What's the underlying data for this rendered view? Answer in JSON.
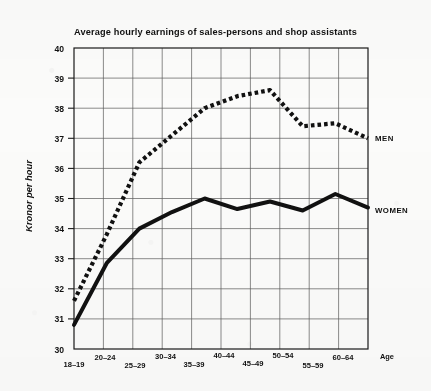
{
  "chart_data": {
    "type": "line",
    "title": "Average hourly earnings of sales-persons and shop assistants",
    "xlabel": "Age",
    "ylabel": "Kronor per hour",
    "categories": [
      "18–19",
      "20–24",
      "25–29",
      "30–34",
      "35–39",
      "40–44",
      "45–49",
      "50–54",
      "55–59",
      "60–64"
    ],
    "ylim": [
      30,
      40
    ],
    "yticks": [
      30,
      31,
      32,
      33,
      34,
      35,
      36,
      37,
      38,
      39,
      40
    ],
    "grid": true,
    "legend_position": "right-of-line-ends",
    "series": [
      {
        "name": "MEN",
        "style": "dotted",
        "color": "#111111",
        "values": [
          31.6,
          33.8,
          36.2,
          37.1,
          38.0,
          38.4,
          38.6,
          37.4,
          37.5,
          37.0
        ]
      },
      {
        "name": "WOMEN",
        "style": "solid",
        "color": "#111111",
        "values": [
          30.8,
          32.85,
          34.0,
          34.55,
          35.0,
          34.65,
          34.9,
          34.6,
          35.15,
          34.7
        ]
      }
    ]
  },
  "axis": {
    "y_label": "Kronor per hour",
    "x_label": "Age",
    "y_tick_labels": [
      "40",
      "39",
      "38",
      "37",
      "36",
      "35",
      "34",
      "33",
      "32",
      "31",
      "30"
    ],
    "x_tick_labels": [
      "18–19",
      "20–24",
      "25–29",
      "30–34",
      "35–39",
      "40–44",
      "45–49",
      "50–54",
      "55–59",
      "60–64"
    ]
  },
  "legend": {
    "men": "MEN",
    "women": "WOMEN"
  }
}
